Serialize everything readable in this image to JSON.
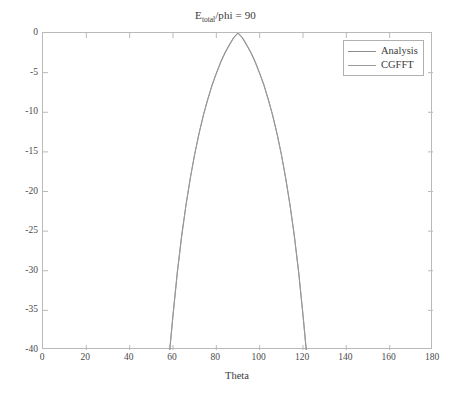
{
  "chart_data": {
    "type": "line",
    "title_main": "E",
    "title_sub": "total",
    "title_rest": "/phi = 90",
    "xlabel": "Theta",
    "ylabel": "",
    "xlim": [
      0,
      180
    ],
    "ylim": [
      -40,
      0
    ],
    "xticks": [
      0,
      20,
      40,
      60,
      80,
      100,
      120,
      140,
      160,
      180
    ],
    "yticks": [
      0,
      -5,
      -10,
      -15,
      -20,
      -25,
      -30,
      -35,
      -40
    ],
    "xtick_labels": [
      "0",
      "20",
      "40",
      "60",
      "80",
      "100",
      "120",
      "140",
      "160",
      "180"
    ],
    "ytick_labels": [
      "0",
      "-5",
      "-10",
      "-15",
      "-20",
      "-25",
      "-30",
      "-35",
      "-40"
    ],
    "grid": false,
    "legend_position": "top-right",
    "series": [
      {
        "name": "Analysis",
        "color": "#8c8c8c",
        "x": [
          58.5,
          60,
          62,
          64,
          66,
          68,
          70,
          72,
          74,
          76,
          78,
          80,
          82,
          84,
          86,
          88,
          90,
          92,
          94,
          96,
          98,
          100,
          102,
          104,
          106,
          108,
          110,
          112,
          114,
          116,
          118,
          120,
          121.5
        ],
        "values": [
          -40,
          -35.6,
          -30.2,
          -25.6,
          -21.7,
          -18.3,
          -15.3,
          -12.7,
          -10.4,
          -8.4,
          -6.6,
          -5.1,
          -3.7,
          -2.5,
          -1.5,
          -0.6,
          0,
          -0.6,
          -1.5,
          -2.5,
          -3.7,
          -5.1,
          -6.6,
          -8.4,
          -10.4,
          -12.7,
          -15.3,
          -18.3,
          -21.7,
          -25.6,
          -30.2,
          -35.6,
          -40
        ]
      },
      {
        "name": "CGFFT",
        "color": "#9a9a9a",
        "x": [
          58.5,
          60,
          62,
          64,
          66,
          68,
          70,
          72,
          74,
          76,
          78,
          80,
          82,
          84,
          86,
          88,
          90,
          92,
          94,
          96,
          98,
          100,
          102,
          104,
          106,
          108,
          110,
          112,
          114,
          116,
          118,
          120,
          121.5
        ],
        "values": [
          -40,
          -35.6,
          -30.2,
          -25.6,
          -21.7,
          -18.3,
          -15.3,
          -12.7,
          -10.4,
          -8.4,
          -6.6,
          -5.1,
          -3.7,
          -2.5,
          -1.5,
          -0.6,
          0,
          -0.6,
          -1.5,
          -2.5,
          -3.7,
          -5.1,
          -6.6,
          -8.4,
          -10.4,
          -12.7,
          -15.3,
          -18.3,
          -21.7,
          -25.6,
          -30.2,
          -35.6,
          -40
        ]
      }
    ],
    "legend": [
      "Analysis",
      "CGFFT"
    ],
    "axis_color": "#b9b9b9",
    "text_color": "#3a3a3a"
  }
}
